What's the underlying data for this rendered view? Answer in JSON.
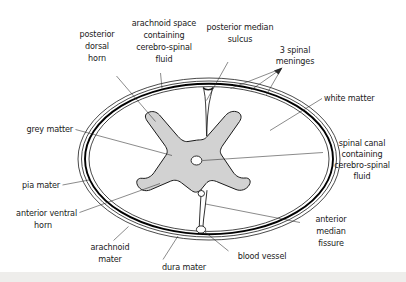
{
  "diagram": {
    "background_color": "#ffffff",
    "ink_color": "#1a1a1a",
    "grey_matter_fill": "#d2d2d2",
    "white_matter_fill": "#ffffff",
    "labels": {
      "posterior_dorsal_horn": "posterior\ndorsal\nhorn",
      "posterior_dorsal_horn_lines": [
        "posterior",
        "dorsal",
        "horn"
      ],
      "arachnoid_space_lines": [
        "arachnoid space",
        "containing",
        "cerebro-spinal",
        "fluid"
      ],
      "posterior_median_sulcus_lines": [
        "posterior median",
        "sulcus"
      ],
      "three_spinal_meninges_lines": [
        "3 spinal",
        "meninges"
      ],
      "white_matter": "white matter",
      "spinal_canal_lines": [
        "spinal canal",
        "containing",
        "cerebro-spinal",
        "fluid"
      ],
      "grey_matter": "grey matter",
      "pia_mater": "pia mater",
      "anterior_ventral_horn_lines": [
        "anterior ventral",
        "horn"
      ],
      "arachnoid_mater_lines": [
        "arachnoid",
        "mater"
      ],
      "dura_mater": "dura mater",
      "blood_vessel": "blood vessel",
      "anterior_median_fissure_lines": [
        "anterior",
        "median",
        "fissure"
      ]
    },
    "structures": [
      {
        "name": "dura-mater",
        "kind": "meningeal-layer",
        "order": 1
      },
      {
        "name": "arachnoid-mater",
        "kind": "meningeal-layer",
        "order": 2
      },
      {
        "name": "arachnoid-space",
        "kind": "fluid-space",
        "order": 3
      },
      {
        "name": "pia-mater",
        "kind": "meningeal-layer",
        "order": 4
      },
      {
        "name": "white-matter",
        "kind": "tissue",
        "order": 5
      },
      {
        "name": "grey-matter",
        "kind": "tissue",
        "order": 6
      },
      {
        "name": "spinal-canal",
        "kind": "fluid-space",
        "order": 7
      }
    ]
  }
}
